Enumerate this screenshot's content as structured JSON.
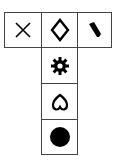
{
  "palette": {
    "title": "Shape tool palette",
    "tools": [
      {
        "id": "delete",
        "label": "Delete",
        "icon": "x-icon"
      },
      {
        "id": "diamond",
        "label": "Diamond",
        "icon": "diamond-outline-icon"
      },
      {
        "id": "brush",
        "label": "Brush",
        "icon": "brush-icon"
      },
      {
        "id": "gear",
        "label": "Gear",
        "icon": "gear-icon"
      },
      {
        "id": "heart",
        "label": "Heart",
        "icon": "heart-outline-icon"
      },
      {
        "id": "circle",
        "label": "Filled circle",
        "icon": "filled-circle-icon"
      }
    ]
  },
  "colors": {
    "border": "#444444",
    "icon": "#000000",
    "background": "#ffffff"
  }
}
